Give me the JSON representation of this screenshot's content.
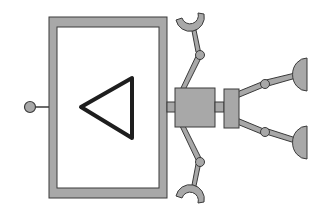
{
  "diagram": {
    "type": "robot-schematic",
    "colors": {
      "fill": "#a8a8a8",
      "stroke": "#3a3a3a",
      "background": "#ffffff",
      "triangle": "#1e1e1e"
    },
    "components": [
      {
        "name": "input-port",
        "shape": "circle"
      },
      {
        "name": "main-body",
        "shape": "rectangle-frame"
      },
      {
        "name": "direction-triangle",
        "shape": "triangle-pointing-left"
      },
      {
        "name": "central-joint-block",
        "shape": "square"
      },
      {
        "name": "wrist-block",
        "shape": "rectangle"
      },
      {
        "name": "upper-arm-with-claw",
        "shape": "linkage"
      },
      {
        "name": "lower-arm-with-claw",
        "shape": "linkage"
      },
      {
        "name": "upper-suction-cup",
        "shape": "linkage"
      },
      {
        "name": "lower-suction-cup",
        "shape": "linkage"
      }
    ]
  }
}
